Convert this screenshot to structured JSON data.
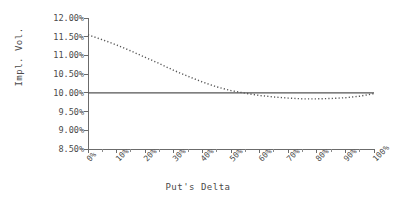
{
  "chart_data": {
    "type": "line",
    "title": "",
    "xlabel": "Put's Delta",
    "ylabel": "Impl. Vol.",
    "xlim": [
      0,
      100
    ],
    "ylim": [
      8.5,
      12.0
    ],
    "grid": false,
    "legend": "none",
    "x_tick_labels": [
      "0%",
      "10%",
      "20%",
      "30%",
      "40%",
      "50%",
      "60%",
      "70%",
      "80%",
      "90%",
      "100%"
    ],
    "x_tick_values": [
      0,
      10,
      20,
      30,
      40,
      50,
      60,
      70,
      80,
      90,
      100
    ],
    "y_tick_labels": [
      "12.00%",
      "11.50%",
      "11.00%",
      "10.50%",
      "10.00%",
      "9.50%",
      "9.00%",
      "8.50%"
    ],
    "y_tick_values": [
      12.0,
      11.5,
      11.0,
      10.5,
      10.0,
      9.5,
      9.0,
      8.5
    ],
    "x": [
      0,
      5,
      10,
      15,
      20,
      25,
      30,
      35,
      40,
      45,
      50,
      55,
      60,
      65,
      70,
      75,
      80,
      85,
      90,
      95,
      100
    ],
    "series": [
      {
        "name": "Constant Volatility",
        "style": "solid",
        "color": "#555555",
        "values": [
          10.0,
          10.0,
          10.0,
          10.0,
          10.0,
          10.0,
          10.0,
          10.0,
          10.0,
          10.0,
          10.0,
          10.0,
          10.0,
          10.0,
          10.0,
          10.0,
          10.0,
          10.0,
          10.0,
          10.0,
          10.0
        ]
      },
      {
        "name": "Implied Volatility Skew",
        "style": "dotted",
        "color": "#555555",
        "values": [
          11.55,
          11.42,
          11.28,
          11.12,
          10.95,
          10.78,
          10.6,
          10.44,
          10.29,
          10.16,
          10.06,
          9.99,
          9.93,
          9.89,
          9.86,
          9.84,
          9.84,
          9.85,
          9.87,
          9.91,
          9.98
        ]
      }
    ]
  }
}
